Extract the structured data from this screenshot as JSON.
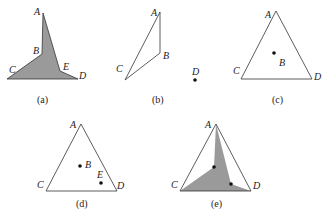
{
  "figure": {
    "colors": {
      "stroke": "#333333",
      "fill": "#9a9a9a",
      "text": "#222222",
      "background": "#ffffff"
    },
    "panels": [
      {
        "id": "a",
        "caption": "(a)",
        "description": "Shaded polygon A-B-C-D-E",
        "points": {
          "A": [
            43,
            13
          ],
          "B": [
            42,
            54
          ],
          "C": [
            7,
            79
          ],
          "D": [
            78,
            79
          ],
          "E": [
            60,
            71
          ]
        },
        "labels": {
          "A": "A",
          "B": "B",
          "C": "C",
          "D": "D",
          "E": "E"
        }
      },
      {
        "id": "b",
        "caption": "(b)",
        "description": "Triangle A-B-C outline with isolated point D",
        "points": {
          "A": [
            160,
            12
          ],
          "B": [
            160,
            53
          ],
          "C": [
            125,
            80
          ],
          "D": [
            195,
            80
          ]
        },
        "labels": {
          "A": "A",
          "B": "B",
          "C": "C",
          "D": "D"
        }
      },
      {
        "id": "c",
        "caption": "(c)",
        "description": "Triangle A-C-D with interior point B",
        "points": {
          "A": [
            276,
            11
          ],
          "B": [
            274,
            53
          ],
          "C": [
            241,
            79
          ],
          "D": [
            312,
            79
          ]
        },
        "labels": {
          "A": "A",
          "B": "B",
          "C": "C",
          "D": "D"
        }
      },
      {
        "id": "d",
        "caption": "(d)",
        "description": "Triangle A-C-D with interior points B and E",
        "points": {
          "A": [
            81,
            124
          ],
          "B": [
            80,
            166
          ],
          "C": [
            46,
            191
          ],
          "D": [
            117,
            191
          ],
          "E": [
            101,
            183
          ]
        },
        "labels": {
          "A": "A",
          "B": "B",
          "C": "C",
          "D": "D",
          "E": "E"
        }
      },
      {
        "id": "e",
        "caption": "(e)",
        "description": "Triangle A-C-D with shaded polygon A-B-C-D-E inside",
        "points": {
          "A": [
            216,
            124
          ],
          "B": [
            214,
            167
          ],
          "C": [
            180,
            191
          ],
          "D": [
            251,
            191
          ],
          "E": [
            231,
            184
          ]
        },
        "labels": {
          "A": "A",
          "C": "C",
          "D": "D"
        }
      }
    ]
  }
}
